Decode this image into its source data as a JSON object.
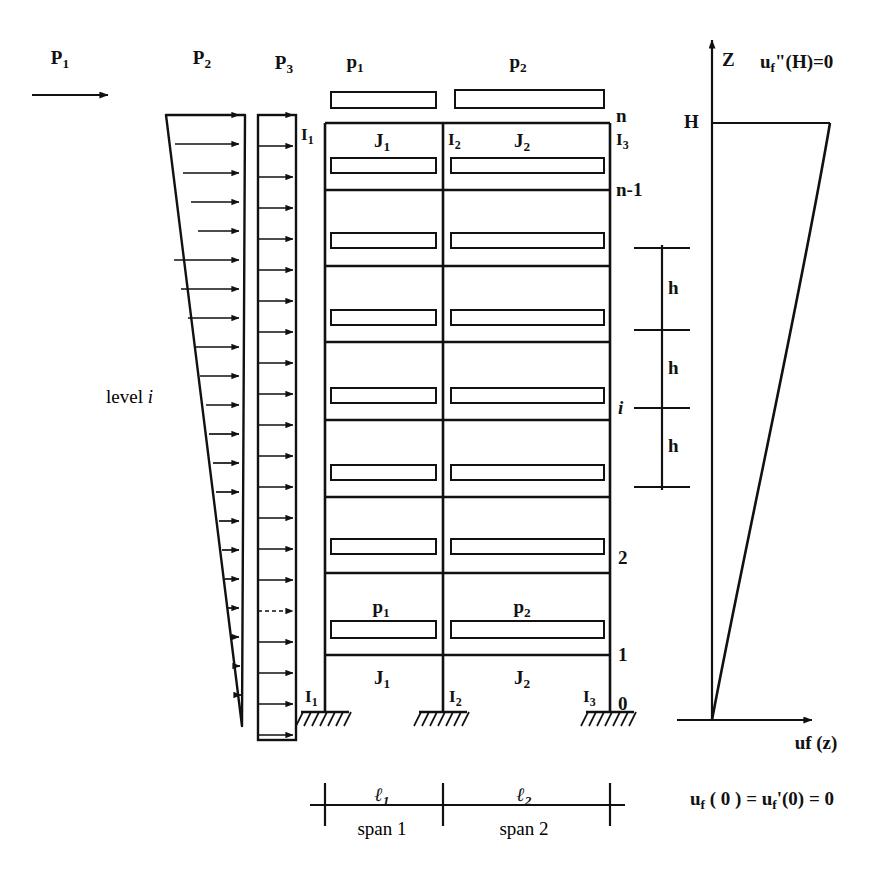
{
  "figure": {
    "kind": "structural-frame-diagram"
  },
  "loads": {
    "p1_point": {
      "label_main": "P",
      "label_sub": "1",
      "type": "concentrated-arrow"
    },
    "p2_triangular": {
      "label_main": "P",
      "label_sub": "2",
      "type": "triangular-distributed",
      "arrow_count": 21
    },
    "p3_uniform": {
      "label_main": "P",
      "label_sub": "3",
      "type": "uniform-distributed",
      "arrow_count": 21
    },
    "level_note": {
      "text": "level",
      "index": "i"
    }
  },
  "frame": {
    "distributed_top": [
      {
        "label_main": "p",
        "label_sub": "1",
        "span": "1"
      },
      {
        "label_main": "p",
        "label_sub": "2",
        "span": "2"
      }
    ],
    "distributed_bottom": [
      {
        "label_main": "p",
        "label_sub": "1",
        "span": "1"
      },
      {
        "label_main": "p",
        "label_sub": "2",
        "span": "2"
      }
    ],
    "columns_top": [
      {
        "label_main": "I",
        "label_sub": "1"
      },
      {
        "label_main": "I",
        "label_sub": "2"
      },
      {
        "label_main": "I",
        "label_sub": "3"
      }
    ],
    "columns_bottom": [
      {
        "label_main": "I",
        "label_sub": "1"
      },
      {
        "label_main": "I",
        "label_sub": "2"
      },
      {
        "label_main": "I",
        "label_sub": "3"
      }
    ],
    "beams_top": [
      {
        "label_main": "J",
        "label_sub": "1"
      },
      {
        "label_main": "J",
        "label_sub": "2"
      }
    ],
    "beams_bottom": [
      {
        "label_main": "J",
        "label_sub": "1"
      },
      {
        "label_main": "J",
        "label_sub": "2"
      }
    ],
    "levels": [
      "n",
      "n-1",
      "i",
      "2",
      "1",
      "0"
    ],
    "storey_count": 7,
    "support_type": "fixed",
    "support_count": 3
  },
  "storey_ladder": {
    "labels": [
      "h",
      "h",
      "h"
    ],
    "level_marker": "i"
  },
  "spans": {
    "length_labels": [
      {
        "symbol": "ℓ",
        "sub": "1"
      },
      {
        "symbol": "ℓ",
        "sub": "2"
      }
    ],
    "names": [
      "span  1",
      "span  2"
    ]
  },
  "cantilever": {
    "axis_vertical": "Z",
    "axis_horizontal_main": "uf",
    "axis_horizontal_arg": "(z)",
    "height_marker": "H",
    "bc_top_main": "u",
    "bc_top_sub": "f",
    "bc_top_rest": "\"(H)=0",
    "bc_bottom": "u_f ( 0 ) = u_f'(0) = 0",
    "bc_bottom_parts": {
      "u1": "u",
      "s1": "f",
      "mid": " ( 0 ) = ",
      "u2": "u",
      "s2": "f",
      "tail": "'(0) = 0"
    }
  },
  "style": {
    "ink": "#111111",
    "paper": "#ffffff"
  }
}
